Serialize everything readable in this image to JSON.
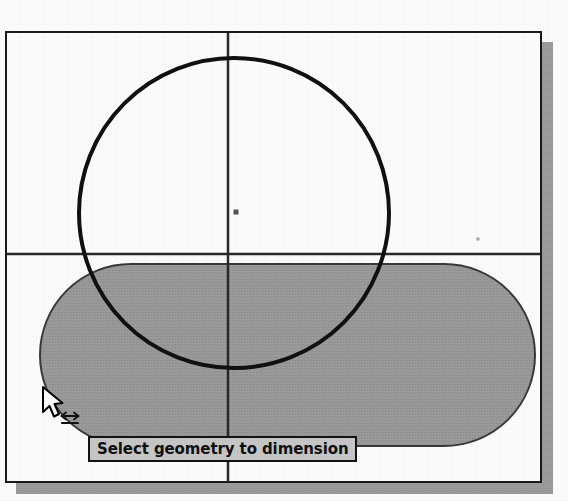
{
  "app": {
    "window_title": "Sketch Drawing Area"
  },
  "viewport": {
    "background_color": "#ffffff",
    "frame_color": "#1a1a1a",
    "shadow_color": "#9d9d9d",
    "frame": {
      "x": 5,
      "y": 31,
      "width": 537,
      "height": 452
    }
  },
  "axes": {
    "vertical_axis_label": "vertical construction axis",
    "horizontal_axis_label": "horizontal construction axis",
    "vertical_x": 221,
    "horizontal_y": 221,
    "color": "#2a2a2a"
  },
  "geometry": {
    "circle": {
      "name": "circle",
      "center_x": 227,
      "center_y": 180,
      "radius": 155,
      "stroke": "#111111",
      "stroke_width": 4,
      "fill": "none"
    },
    "slot": {
      "name": "rounded-slot",
      "x": 33,
      "y": 231,
      "width": 495,
      "height": 182,
      "corner_radius": 91,
      "fill": "#9a9a9a",
      "stroke": "#3a3a3a",
      "stroke_width": 2
    },
    "center_point": {
      "name": "circle-center-point",
      "x": 229,
      "y": 179,
      "size": 5,
      "color": "#555555"
    },
    "reference_point": {
      "name": "reference-point",
      "x": 471,
      "y": 206,
      "size": 3,
      "color": "#aaaaaa"
    }
  },
  "tooltip": {
    "text": "Select geometry to dimension",
    "background": "#c9c9c9",
    "border_color": "#141414",
    "x": 81,
    "y": 403,
    "width": 244,
    "height": 26
  },
  "cursor": {
    "name": "dimension-tool-cursor",
    "x": 33,
    "y": 352,
    "arrow_fill": "#ffffff",
    "arrow_stroke": "#000000",
    "badge_icon": "double-arrow-horizontal-icon"
  }
}
